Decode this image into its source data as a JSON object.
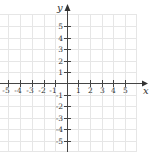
{
  "diagram": {
    "type": "cartesian-coordinate-plane",
    "x_axis": {
      "label": "x",
      "ticks": [
        "-5",
        "-4",
        "-3",
        "-2",
        "-1",
        "1",
        "2",
        "3",
        "4",
        "5"
      ]
    },
    "y_axis": {
      "label": "y",
      "ticks": [
        "5",
        "4",
        "3",
        "2",
        "1",
        "-1",
        "-2",
        "-3",
        "-4",
        "-5"
      ]
    },
    "grid": true,
    "colors": {
      "axis": "#444444",
      "grid": "#e4e4e4",
      "text": "#333333"
    }
  }
}
